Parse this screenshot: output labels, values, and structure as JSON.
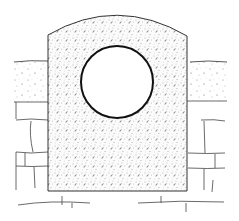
{
  "diagram": {
    "type": "technical-illustration",
    "subject": "headwall with circular pipe opening set in stone masonry",
    "elements": {
      "headwall": {
        "shape": "rectangle with arched top",
        "fill": "stippled concrete",
        "x": 48,
        "y_top_side": 35,
        "y_peak": 10,
        "width": 139,
        "y_bottom": 191
      },
      "pipe_opening": {
        "shape": "circle",
        "cx": 117,
        "cy": 82,
        "r": 36,
        "stroke": "#111111"
      },
      "soil_left": {
        "x": 14,
        "y": 61,
        "width": 34,
        "height": 41
      },
      "soil_right": {
        "x": 187,
        "y": 61,
        "width": 40,
        "height": 40
      },
      "masonry_left": {
        "courses": 3
      },
      "masonry_right": {
        "courses": 3
      },
      "ground_lines": 2
    },
    "colors": {
      "line": "#333333",
      "pipe_outline": "#111111",
      "stipple": "#555555",
      "background": "#ffffff"
    }
  }
}
